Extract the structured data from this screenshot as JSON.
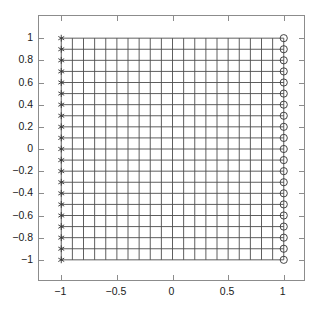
{
  "chart_data": {
    "type": "scatter",
    "title": "",
    "xlabel": "",
    "ylabel": "",
    "xlim": [
      -1.2,
      1.2
    ],
    "ylim": [
      -1.2,
      1.2
    ],
    "grid": true,
    "legend": null,
    "xticks": [
      -1,
      -0.5,
      0,
      0.5,
      1
    ],
    "xticklabels": [
      "−1",
      "−0.5",
      "0",
      "0.5",
      "1"
    ],
    "yticks": [
      1,
      0.8,
      0.6,
      0.4,
      0.2,
      0,
      -0.2,
      -0.4,
      -0.6,
      -0.8,
      -1
    ],
    "yticklabels": [
      "1",
      "0.8",
      "0.6",
      "0.4",
      "0.2",
      "0",
      "−0.2",
      "−0.4",
      "−0.6",
      "−0.8",
      "−1"
    ],
    "mesh": {
      "x_domain": [
        -1,
        1
      ],
      "y_domain": [
        -1,
        1
      ],
      "nx_cells": 20,
      "ny_cells": 20,
      "nx_lines": 21,
      "ny_lines": 21,
      "line_color": "#4d4d4d",
      "description": "uniform square structured mesh over [-1,1] x [-1,1]"
    },
    "series": [
      {
        "name": "left-boundary-nodes",
        "marker": "*",
        "color": "#333333",
        "x": [
          -1,
          -1,
          -1,
          -1,
          -1,
          -1,
          -1,
          -1,
          -1,
          -1,
          -1,
          -1,
          -1,
          -1,
          -1,
          -1,
          -1,
          -1,
          -1,
          -1,
          -1
        ],
        "y": [
          1,
          0.9,
          0.8,
          0.7,
          0.6,
          0.5,
          0.4,
          0.3,
          0.2,
          0.1,
          0,
          -0.1,
          -0.2,
          -0.3,
          -0.4,
          -0.5,
          -0.6,
          -0.7,
          -0.8,
          -0.9,
          -1
        ]
      },
      {
        "name": "right-boundary-nodes",
        "marker": "o",
        "color": "#333333",
        "x": [
          1,
          1,
          1,
          1,
          1,
          1,
          1,
          1,
          1,
          1,
          1,
          1,
          1,
          1,
          1,
          1,
          1,
          1,
          1,
          1,
          1
        ],
        "y": [
          1,
          0.9,
          0.8,
          0.7,
          0.6,
          0.5,
          0.4,
          0.3,
          0.2,
          0.1,
          0,
          -0.1,
          -0.2,
          -0.3,
          -0.4,
          -0.5,
          -0.6,
          -0.7,
          -0.8,
          -0.9,
          -1
        ]
      }
    ]
  },
  "style": {
    "axis_color": "#8c8c8c",
    "grid_color": "#4d4d4d",
    "marker_color": "#333333",
    "background": "#ffffff",
    "text_color": "#1a1a1a"
  }
}
